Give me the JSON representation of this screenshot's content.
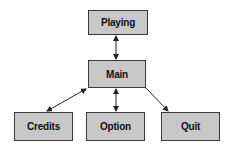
{
  "diagram": {
    "type": "state-flow",
    "nodes": [
      {
        "id": "playing",
        "label": "Playing",
        "x": 88,
        "y": 10,
        "w": 60,
        "h": 25
      },
      {
        "id": "main",
        "label": "Main",
        "x": 88,
        "y": 60,
        "w": 58,
        "h": 28
      },
      {
        "id": "credits",
        "label": "Credits",
        "x": 14,
        "y": 112,
        "w": 59,
        "h": 29
      },
      {
        "id": "option",
        "label": "Option",
        "x": 86,
        "y": 112,
        "w": 59,
        "h": 29
      },
      {
        "id": "quit",
        "label": "Quit",
        "x": 161,
        "y": 112,
        "w": 59,
        "h": 29
      }
    ],
    "edges": [
      {
        "from": "main",
        "to": "playing",
        "direction": "both"
      },
      {
        "from": "main",
        "to": "credits",
        "direction": "both"
      },
      {
        "from": "main",
        "to": "option",
        "direction": "both"
      },
      {
        "from": "main",
        "to": "quit",
        "direction": "forward"
      }
    ],
    "colors": {
      "node_fill": "#c8c8c8",
      "node_border": "#3a3a3a",
      "edge": "#222222"
    }
  }
}
